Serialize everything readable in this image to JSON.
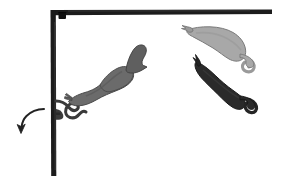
{
  "figure": {
    "title": "Scientific illustration: organisms attached to and detaching from an L-shaped substrate",
    "canvas": {
      "width": 288,
      "height": 183,
      "background": "#ffffff"
    },
    "palette": {
      "substrate": "#1c1c1c",
      "node": "#111111",
      "organism_mid_gray": "#6b6b6b",
      "organism_light_gray": "#a8a8a8",
      "organism_dark": "#2a2a2a",
      "outline": "#1a1a1a",
      "arrow": "#222222",
      "background": "#ffffff"
    },
    "substrate": {
      "label": "L-shaped substrate frame",
      "corner_x": 53,
      "corner_y": 12,
      "horizontal_bar": {
        "x1": 53,
        "y1": 12,
        "x2": 272,
        "y2": 12,
        "thickness": 5
      },
      "vertical_bar": {
        "x1": 53,
        "y1": 12,
        "x2": 53,
        "y2": 176,
        "thickness": 5
      },
      "corner_node": {
        "cx": 62,
        "cy": 16,
        "size": 7
      }
    },
    "organisms": [
      {
        "id": "attached-organism",
        "label": "Attached organism with coiled stalk",
        "fill": "#6b6b6b",
        "state": "attached",
        "orientation_deg": -28,
        "anchor_x": 56,
        "anchor_y": 104
      },
      {
        "id": "detached-organism-light",
        "label": "Detached organism, light gray",
        "fill": "#a8a8a8",
        "state": "detached",
        "orientation_deg": 18,
        "anchor_x": 186,
        "anchor_y": 28
      },
      {
        "id": "detached-organism-dark",
        "label": "Detached organism, dark",
        "fill": "#2a2a2a",
        "state": "detached",
        "orientation_deg": 42,
        "anchor_x": 196,
        "anchor_y": 60
      }
    ],
    "stalk": {
      "label": "Coiled attachment stalk",
      "color": "#3a3a3a",
      "thickness": 3
    },
    "arrow": {
      "label": "Direction-of-motion arrow",
      "color": "#222222",
      "start_x": 44,
      "start_y": 110,
      "end_x": 21,
      "end_y": 132,
      "head_size": 7,
      "direction": "down-left"
    }
  }
}
